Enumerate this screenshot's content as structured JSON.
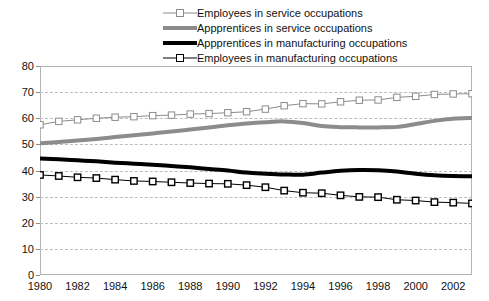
{
  "chart_data": {
    "type": "line",
    "title": "",
    "xlabel": "",
    "ylabel": "",
    "xlim": [
      1980,
      2003
    ],
    "ylim": [
      0,
      80
    ],
    "y_ticks": [
      0,
      10,
      20,
      30,
      40,
      50,
      60,
      70,
      80
    ],
    "x_ticks": [
      1980,
      1982,
      1984,
      1986,
      1988,
      1990,
      1992,
      1994,
      1996,
      1998,
      2000,
      2002
    ],
    "x": [
      1980,
      1981,
      1982,
      1983,
      1984,
      1985,
      1986,
      1987,
      1988,
      1989,
      1990,
      1991,
      1992,
      1993,
      1994,
      1995,
      1996,
      1997,
      1998,
      1999,
      2000,
      2001,
      2002,
      2003
    ],
    "grid": "horizontal-dashed",
    "legend_position": "top-center",
    "series": [
      {
        "name": "Employees in service occupations",
        "color": "#8c8c8c",
        "marker": "square-open",
        "line_width": 1,
        "values": [
          57.5,
          58.8,
          59.4,
          60.0,
          60.4,
          60.6,
          61.0,
          61.2,
          61.6,
          61.8,
          62.1,
          62.5,
          63.5,
          64.8,
          65.6,
          65.5,
          66.3,
          66.9,
          67.0,
          68.0,
          68.4,
          69.1,
          69.3,
          69.4
        ]
      },
      {
        "name": "Appprentices in service occupations",
        "color": "#8c8c8c",
        "marker": "none",
        "line_width": 4,
        "values": [
          50.4,
          50.9,
          51.5,
          52.1,
          52.8,
          53.5,
          54.2,
          54.9,
          55.7,
          56.5,
          57.3,
          58.0,
          58.5,
          58.8,
          58.2,
          57.0,
          56.6,
          56.5,
          56.5,
          56.7,
          57.8,
          59.0,
          59.8,
          60.1
        ]
      },
      {
        "name": "Appprentices in manufacturing occupations",
        "color": "#000000",
        "marker": "none",
        "line_width": 4,
        "values": [
          44.6,
          44.3,
          43.9,
          43.5,
          43.0,
          42.6,
          42.2,
          41.7,
          41.2,
          40.6,
          40.0,
          39.2,
          38.8,
          38.5,
          38.4,
          39.2,
          39.9,
          40.2,
          40.1,
          39.6,
          38.8,
          38.2,
          37.9,
          37.8
        ]
      },
      {
        "name": "Employees in manufacturing occupations",
        "color": "#000000",
        "marker": "square-open",
        "line_width": 1,
        "values": [
          38.3,
          37.9,
          37.4,
          37.1,
          36.5,
          36.0,
          35.8,
          35.5,
          35.2,
          35.0,
          34.9,
          34.4,
          33.6,
          32.3,
          31.5,
          31.3,
          30.5,
          29.9,
          29.8,
          28.8,
          28.5,
          27.9,
          27.7,
          27.4
        ]
      }
    ]
  },
  "legend": {
    "items": [
      {
        "label": "Employees in service occupations"
      },
      {
        "label": "Appprentices in service occupations"
      },
      {
        "label": "Appprentices in manufacturing occupations"
      },
      {
        "label": "Employees in manufacturing occupations"
      }
    ]
  }
}
